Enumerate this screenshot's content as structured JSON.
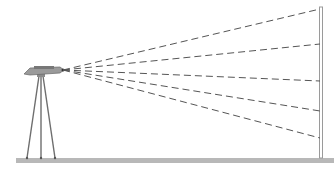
{
  "diagram": {
    "colors": {
      "background": "#ffffff",
      "ground": "#b8b8b8",
      "tripod": "#6e6e6e",
      "instrument": "#7a7a7a",
      "beam": "#555555",
      "wall_stroke": "#9a9a9a",
      "wall_fill": "#ffffff"
    },
    "origin": {
      "x": 63,
      "y": 70
    },
    "beam_targets_y": [
      9,
      44,
      81,
      111,
      138
    ],
    "wall": {
      "x": 320,
      "top": 7,
      "bottom": 158,
      "width": 3
    },
    "ground": {
      "x1": 16,
      "x2": 334,
      "y": 158,
      "height": 5
    },
    "tripod_feet_x": [
      27,
      41,
      55
    ]
  }
}
